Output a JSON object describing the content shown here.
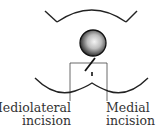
{
  "diagram": {
    "labels": {
      "mediolateral": {
        "line1": "Mediolateral",
        "line2": "incision"
      },
      "medial": {
        "line1": "Medial",
        "line2": "incision"
      }
    },
    "elements": [
      "upper-arc",
      "fetal-head",
      "perineum-curve",
      "incision-box",
      "mediolateral-cut",
      "medial-cut"
    ],
    "colors": {
      "stroke": "#222222",
      "text": "#333333",
      "background": "#ffffff"
    }
  }
}
